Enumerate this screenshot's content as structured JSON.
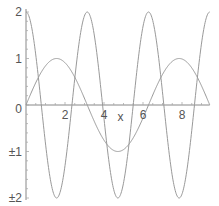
{
  "chart_data": {
    "type": "line",
    "title": "",
    "xlabel": "x",
    "ylabel": "",
    "xlim": [
      0,
      9.42
    ],
    "ylim": [
      -2,
      2
    ],
    "grid": false,
    "legend": null,
    "x_ticks": [
      "2",
      "4",
      "6",
      "8"
    ],
    "y_ticks": [
      "2",
      "1",
      "0",
      "±1",
      "±2"
    ],
    "series": [
      {
        "name": "sin(x)",
        "expression": "sin(x)",
        "color": "#999999"
      },
      {
        "name": "2cos(2x)",
        "expression": "2*cos(2*x)",
        "color": "#999999"
      }
    ],
    "sample_points": {
      "x": [
        0,
        0.785,
        1.571,
        2.356,
        3.142,
        3.927,
        4.712,
        5.498,
        6.283,
        7.069,
        7.854,
        8.639,
        9.425
      ],
      "sin_x": [
        0,
        0.71,
        1,
        0.71,
        0,
        -0.71,
        -1,
        -0.71,
        0,
        0.71,
        1,
        0.71,
        0
      ],
      "two_cos_2x": [
        2,
        0,
        -2,
        0,
        2,
        0,
        -2,
        0,
        2,
        0,
        -2,
        0,
        2
      ]
    }
  },
  "axes": {
    "x_label": "x",
    "x_tick_labels": [
      {
        "value": 2,
        "label": "2"
      },
      {
        "value": 4,
        "label": "4"
      },
      {
        "value": 6,
        "label": "6"
      },
      {
        "value": 8,
        "label": "8"
      }
    ],
    "y_tick_labels": [
      {
        "value": 2,
        "label": "2"
      },
      {
        "value": 1,
        "label": "1"
      },
      {
        "value": 0,
        "label": "0"
      },
      {
        "value": -1,
        "label": "±1"
      },
      {
        "value": -2,
        "label": "±2"
      }
    ]
  }
}
